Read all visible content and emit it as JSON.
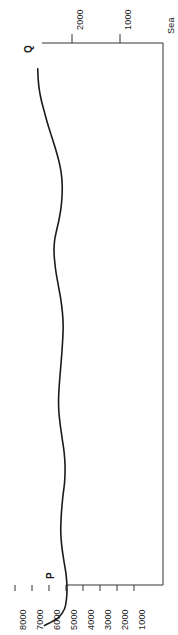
{
  "figure": {
    "title": "",
    "background_color": "#ffffff",
    "line_color": "#1a1a1a",
    "axis_color": "#333333",
    "text_color": "#1a1a1a",
    "orientation": "rotated-90"
  },
  "labels": {
    "sea_level_line1": "Sea",
    "sea_level_line2": "level",
    "marker_q": "Q",
    "marker_p": "P"
  },
  "chart_data": {
    "type": "line",
    "title": "",
    "subtitle": "",
    "orientation": "rotated-90",
    "xlabel": "",
    "ylabel": "",
    "depth_axis": {
      "name": "elevation-below-sea-level",
      "unit": "m",
      "position": "top",
      "tick_labels": [
        "2000",
        "1000",
        "Sea level"
      ],
      "tick_values": [
        2000,
        1000,
        0
      ],
      "range": [
        2600,
        0
      ]
    },
    "time_axis": {
      "name": "age",
      "unit": "years BP",
      "position": "bottom",
      "tick_labels": [
        "8000",
        "7000",
        "6000",
        "5000",
        "4000",
        "3000",
        "2000",
        "1000"
      ],
      "tick_values": [
        8000,
        7000,
        6000,
        5000,
        4000,
        3000,
        2000,
        1000
      ],
      "range": [
        8600,
        600
      ]
    },
    "grid": false,
    "legend": null,
    "annotations": [
      {
        "label": "Q",
        "x": 0,
        "y": 48
      },
      {
        "label": "P",
        "x": 5900,
        "y": 2250
      }
    ],
    "series": [
      {
        "name": "sea-level-curve",
        "points": [
          [
            0,
            2470
          ],
          [
            120,
            2180
          ],
          [
            250,
            2050
          ],
          [
            400,
            2010
          ],
          [
            560,
            2000
          ],
          [
            760,
            2020
          ],
          [
            980,
            2070
          ],
          [
            1180,
            2110
          ],
          [
            1380,
            2130
          ],
          [
            1620,
            2120
          ],
          [
            1880,
            2090
          ],
          [
            2120,
            2050
          ],
          [
            2350,
            2040
          ],
          [
            2560,
            2060
          ],
          [
            2760,
            2100
          ],
          [
            2960,
            2140
          ],
          [
            3160,
            2170
          ],
          [
            3360,
            2175
          ],
          [
            3560,
            2160
          ],
          [
            3780,
            2135
          ],
          [
            4000,
            2110
          ],
          [
            4220,
            2090
          ],
          [
            4420,
            2080
          ],
          [
            4620,
            2095
          ],
          [
            4820,
            2130
          ],
          [
            5020,
            2180
          ],
          [
            5220,
            2230
          ],
          [
            5400,
            2260
          ],
          [
            5560,
            2270
          ],
          [
            5700,
            2255
          ],
          [
            5840,
            2215
          ],
          [
            5980,
            2170
          ],
          [
            6140,
            2130
          ],
          [
            6320,
            2105
          ],
          [
            6500,
            2100
          ],
          [
            6680,
            2120
          ],
          [
            6860,
            2170
          ],
          [
            7040,
            2240
          ],
          [
            7220,
            2320
          ],
          [
            7400,
            2400
          ],
          [
            7580,
            2470
          ],
          [
            7740,
            2530
          ],
          [
            7900,
            2575
          ],
          [
            8060,
            2600
          ],
          [
            8220,
            2610
          ]
        ]
      }
    ]
  }
}
